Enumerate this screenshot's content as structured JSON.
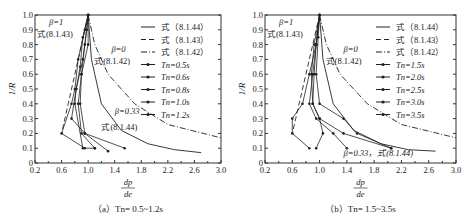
{
  "chart_data": [
    {
      "type": "line",
      "panel_caption": "（a）Tn= 0.5~1.2s",
      "xlabel": "dp/de",
      "ylabel": "1/R",
      "xlim": [
        0.2,
        3.0
      ],
      "ylim": [
        0,
        1.0
      ],
      "xticks": [
        "0.2",
        "0.6",
        "1.0",
        "1.4",
        "1.8",
        "2.2",
        "2.6",
        "3.0"
      ],
      "yticks": [
        "0",
        "0.1",
        "0.2",
        "0.3",
        "0.4",
        "0.5",
        "0.6",
        "0.7",
        "0.8",
        "0.9",
        "1.0"
      ],
      "legend": [
        "式（8.1.44）",
        "式（8.1.43）",
        "式（8.1.42）",
        "Tn=0.5s",
        "Tn=0.6s",
        "Tn=0.8s",
        "Tn=1.0s",
        "Tn=1.2s"
      ],
      "annotations": [
        "β=1 式(8.1.43)",
        "β=0 式(8.1.42)",
        "β=0.33 式(8.1.44)"
      ],
      "series": [
        {
          "name": "式（8.1.44）",
          "style": "solid",
          "x": [
            1.0,
            1.05,
            1.2,
            1.5,
            1.9,
            2.3,
            2.7
          ],
          "y": [
            1.0,
            0.7,
            0.4,
            0.22,
            0.13,
            0.09,
            0.07
          ]
        },
        {
          "name": "式（8.1.43）",
          "style": "dashed",
          "x": [
            1.0,
            0.9,
            0.8,
            0.7,
            0.65,
            0.6
          ],
          "y": [
            1.0,
            0.8,
            0.6,
            0.4,
            0.3,
            0.2
          ]
        },
        {
          "name": "式（8.1.42）",
          "style": "dashdot",
          "x": [
            1.0,
            1.1,
            1.3,
            1.7,
            2.2,
            3.0
          ],
          "y": [
            1.0,
            0.8,
            0.6,
            0.4,
            0.26,
            0.17
          ]
        },
        {
          "name": "Tn=0.5s",
          "x": [
            1.0,
            0.95,
            0.85,
            0.8,
            0.75,
            0.6,
            0.95,
            1.1
          ],
          "y": [
            1.0,
            0.9,
            0.7,
            0.5,
            0.4,
            0.2,
            0.1,
            0.1
          ]
        },
        {
          "name": "Tn=0.6s",
          "x": [
            1.0,
            0.92,
            0.88,
            0.82,
            0.75,
            0.95,
            1.55
          ],
          "y": [
            1.0,
            0.85,
            0.65,
            0.5,
            0.3,
            0.2,
            0.1
          ]
        },
        {
          "name": "Tn=0.8s",
          "x": [
            1.0,
            0.95,
            0.9,
            0.85,
            0.9,
            1.1
          ],
          "y": [
            1.0,
            0.8,
            0.6,
            0.4,
            0.2,
            0.1
          ]
        },
        {
          "name": "Tn=1.0s",
          "x": [
            1.0,
            0.98,
            0.92,
            0.82,
            0.8,
            0.92
          ],
          "y": [
            1.0,
            0.9,
            0.7,
            0.5,
            0.4,
            0.1
          ]
        },
        {
          "name": "Tn=1.2s",
          "x": [
            1.0,
            1.0,
            0.9,
            0.88,
            0.95,
            1.3
          ],
          "y": [
            1.0,
            0.8,
            0.6,
            0.4,
            0.2,
            0.08
          ]
        }
      ]
    },
    {
      "type": "line",
      "panel_caption": "（b）Tn= 1.5~3.5s",
      "xlabel": "dp/de",
      "ylabel": "1/R",
      "xlim": [
        0.2,
        3.0
      ],
      "ylim": [
        0,
        1.0
      ],
      "xticks": [
        "0.2",
        "0.6",
        "1.0",
        "1.4",
        "1.8",
        "2.2",
        "2.6",
        "3.0"
      ],
      "yticks": [
        "0",
        "0.1",
        "0.2",
        "0.3",
        "0.4",
        "0.5",
        "0.6",
        "0.7",
        "0.8",
        "0.9",
        "1.0"
      ],
      "legend": [
        "式（8.1.44）",
        "式（8.1.43）",
        "式（8.1.42）",
        "Tn=1.5s",
        "Tn=2.0s",
        "Tn=2.5s",
        "Tn=3.0s",
        "Tn=3.5s"
      ],
      "annotations": [
        "β=1 式(8.1.43)",
        "β=0 式(8.1.42)",
        "β=0.33，式(8.1.44)"
      ],
      "series": [
        {
          "name": "式（8.1.44）",
          "style": "solid",
          "x": [
            1.0,
            1.05,
            1.2,
            1.5,
            1.9,
            2.3,
            2.7
          ],
          "y": [
            1.0,
            0.7,
            0.4,
            0.22,
            0.13,
            0.09,
            0.08
          ]
        },
        {
          "name": "式（8.1.43）",
          "style": "dashed",
          "x": [
            1.0,
            0.9,
            0.8,
            0.7,
            0.65,
            0.6
          ],
          "y": [
            1.0,
            0.8,
            0.6,
            0.4,
            0.3,
            0.2
          ]
        },
        {
          "name": "式（8.1.42）",
          "style": "dashdot",
          "x": [
            1.0,
            1.1,
            1.3,
            1.7,
            2.2,
            3.0
          ],
          "y": [
            1.0,
            0.8,
            0.6,
            0.4,
            0.26,
            0.17
          ]
        },
        {
          "name": "Tn=1.5s",
          "x": [
            1.0,
            0.95,
            0.85,
            0.75,
            0.6,
            0.6,
            0.85
          ],
          "y": [
            1.0,
            0.8,
            0.6,
            0.4,
            0.3,
            0.2,
            0.1
          ]
        },
        {
          "name": "Tn=2.0s",
          "x": [
            1.0,
            0.92,
            0.88,
            0.9,
            1.0,
            1.35,
            2.05
          ],
          "y": [
            1.0,
            0.8,
            0.6,
            0.4,
            0.3,
            0.2,
            0.1
          ]
        },
        {
          "name": "Tn=2.5s",
          "x": [
            1.0,
            0.98,
            0.95,
            1.0,
            1.35,
            1.55,
            2.05
          ],
          "y": [
            1.0,
            0.85,
            0.6,
            0.4,
            0.3,
            0.2,
            0.1
          ]
        },
        {
          "name": "Tn=3.0s",
          "x": [
            1.0,
            0.95,
            0.9,
            0.85,
            0.95,
            1.2,
            1.4
          ],
          "y": [
            1.0,
            0.8,
            0.6,
            0.4,
            0.3,
            0.2,
            0.1
          ]
        },
        {
          "name": "Tn=3.5s",
          "x": [
            1.0,
            0.95,
            0.92,
            0.9,
            1.0,
            1.05,
            0.95
          ],
          "y": [
            1.0,
            0.8,
            0.6,
            0.4,
            0.3,
            0.2,
            0.1
          ]
        }
      ]
    }
  ],
  "panels": [
    {
      "caption": "（a）Tn= 0.5~1.2s",
      "ylabel": "1/R",
      "xlabel_num": "dp",
      "xlabel_den": "de",
      "legend": [
        "式（8.1.44）",
        "式（8.1.43）",
        "式（8.1.42）",
        "Tn=0.5s",
        "Tn=0.6s",
        "Tn=0.8s",
        "Tn=1.0s",
        "Tn=1.2s"
      ],
      "ann1a": "β=1",
      "ann1b": "式(8.1.43)",
      "ann2a": "β=0",
      "ann2b": "式(8.1.42)",
      "ann3a": "β=0.33",
      "ann3b": "式(8.1.44)"
    },
    {
      "caption": "（b）Tn= 1.5~3.5s",
      "ylabel": "1/R",
      "xlabel_num": "dp",
      "xlabel_den": "de",
      "legend": [
        "式（8.1.44）",
        "式（8.1.43）",
        "式（8.1.42）",
        "Tn=1.5s",
        "Tn=2.0s",
        "Tn=2.5s",
        "Tn=3.0s",
        "Tn=3.5s"
      ],
      "ann1a": "β=1",
      "ann1b": "式(8.1.43)",
      "ann2a": "β=0",
      "ann2b": "式(8.1.42)",
      "ann3a": "β=0.33，式(8.1.44)"
    }
  ]
}
